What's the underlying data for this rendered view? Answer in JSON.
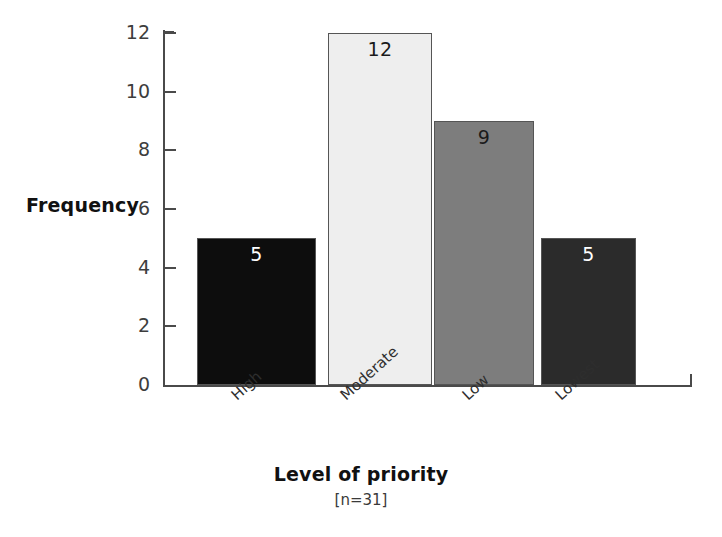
{
  "chart_data": {
    "type": "bar",
    "title": "",
    "categories": [
      "High",
      "Moderate",
      "Low",
      "Lowest"
    ],
    "values": [
      5,
      12,
      9,
      5
    ],
    "value_labels": [
      "5",
      "12",
      "9",
      "5"
    ],
    "bar_colors": [
      "#0d0d0d",
      "#eeeeee",
      "#7d7d7d",
      "#2b2b2b"
    ],
    "bar_label_colors": [
      "#ffffff",
      "#1a1a1a",
      "#1a1a1a",
      "#ffffff"
    ],
    "bar_border_color": "#555555",
    "xlabel": "Level of priority",
    "xlabel_note": "[n=31]",
    "ylabel": "Frequency",
    "ylim": [
      0,
      12
    ],
    "yticks": [
      0,
      2,
      4,
      6,
      8,
      10,
      12
    ],
    "ytick_labels": [
      "0",
      "2",
      "4",
      "6",
      "8",
      "10",
      "12"
    ],
    "grid": false,
    "legend": "none",
    "axis_color": "#4a4a4a",
    "background": "#ffffff",
    "sample_size": 31
  }
}
